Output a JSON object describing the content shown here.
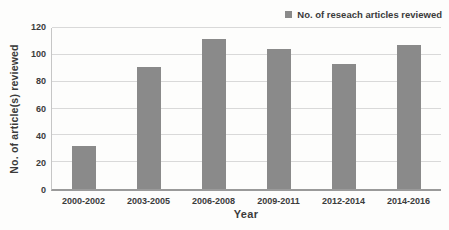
{
  "chart_data": {
    "type": "bar",
    "title": "",
    "legend": "No. of reseach articles reviewed",
    "legend_position": "top-right",
    "categories": [
      "2000-2002",
      "2003-2005",
      "2006-2008",
      "2009-2011",
      "2012-2014",
      "2014-2016"
    ],
    "values": [
      32,
      91,
      112,
      104,
      93,
      107
    ],
    "xlabel": "Year",
    "ylabel": "No. of article(s) reviewed",
    "ylim": [
      0,
      120
    ],
    "yticks": [
      0,
      20,
      40,
      60,
      80,
      100,
      120
    ],
    "grid": true,
    "bar_color": "#8a8a8a",
    "gridline_color": "#d9d9d9",
    "axis_color": "#9a9a9a",
    "text_color": "#3b3b3b"
  }
}
